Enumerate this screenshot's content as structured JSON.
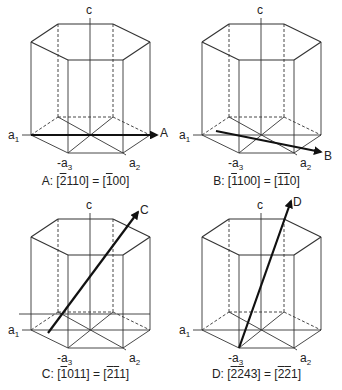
{
  "figure": {
    "panels": [
      {
        "id": "A",
        "arrow_label": "A",
        "axis_labels": {
          "c": "c",
          "a1": "a",
          "a1_sub": "1",
          "a2": "a",
          "a2_sub": "2",
          "a3": "-a",
          "a3_sub": "3"
        },
        "caption": {
          "prefix": "A: [",
          "four_index": [
            {
              "t": "2",
              "bar": true
            },
            {
              "t": "1",
              "bar": false
            },
            {
              "t": "1",
              "bar": false
            },
            {
              "t": "0",
              "bar": false
            }
          ],
          "mid": "] = [",
          "three_index": [
            {
              "t": "1",
              "bar": true
            },
            {
              "t": "0",
              "bar": false
            },
            {
              "t": "0",
              "bar": false
            }
          ],
          "suffix": "]"
        },
        "caption_text": "A: [-2110] = [-100]"
      },
      {
        "id": "B",
        "arrow_label": "B",
        "axis_labels": {
          "c": "c",
          "a1": "a",
          "a1_sub": "1",
          "a2": "a",
          "a2_sub": "2",
          "a3": "-a",
          "a3_sub": "3"
        },
        "caption": {
          "prefix": "B: [",
          "four_index": [
            {
              "t": "1",
              "bar": true
            },
            {
              "t": "1",
              "bar": false
            },
            {
              "t": "0",
              "bar": false
            },
            {
              "t": "0",
              "bar": false
            }
          ],
          "mid": "] = [",
          "three_index": [
            {
              "t": "1",
              "bar": true
            },
            {
              "t": "1",
              "bar": true
            },
            {
              "t": "0",
              "bar": false
            }
          ],
          "suffix": "]"
        },
        "caption_text": "B: [-1100] = [-1-10]"
      },
      {
        "id": "C",
        "arrow_label": "C",
        "axis_labels": {
          "c": "c",
          "a1": "a",
          "a1_sub": "1",
          "a2": "a",
          "a2_sub": "2",
          "a3": "-a",
          "a3_sub": "3"
        },
        "caption": {
          "prefix": "C: [",
          "four_index": [
            {
              "t": "1",
              "bar": true
            },
            {
              "t": "0",
              "bar": false
            },
            {
              "t": "1",
              "bar": false
            },
            {
              "t": "1",
              "bar": false
            }
          ],
          "mid": "] = [",
          "three_index": [
            {
              "t": "2",
              "bar": true
            },
            {
              "t": "1",
              "bar": true
            },
            {
              "t": "1",
              "bar": false
            }
          ],
          "suffix": "]"
        },
        "caption_text": "C: [-1011] = [-2-11]"
      },
      {
        "id": "D",
        "arrow_label": "D",
        "axis_labels": {
          "c": "c",
          "a1": "a",
          "a1_sub": "1",
          "a2": "a",
          "a2_sub": "2",
          "a3": "-a",
          "a3_sub": "3"
        },
        "caption": {
          "prefix": "D: [",
          "four_index": [
            {
              "t": "2",
              "bar": true
            },
            {
              "t": "2",
              "bar": true
            },
            {
              "t": "4",
              "bar": false
            },
            {
              "t": "3",
              "bar": false
            }
          ],
          "mid": "] = [",
          "three_index": [
            {
              "t": "2",
              "bar": true
            },
            {
              "t": "2",
              "bar": true
            },
            {
              "t": "1",
              "bar": false
            }
          ],
          "suffix": "]"
        },
        "caption_text": "D: [-2-243] = [-2-21]"
      }
    ],
    "colors": {
      "line": "#333333",
      "arrow": "#111111",
      "background": "#ffffff"
    }
  }
}
